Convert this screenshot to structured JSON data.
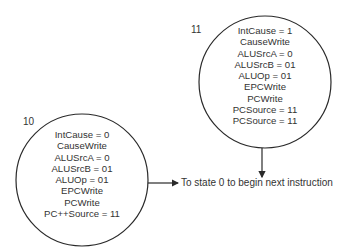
{
  "states": [
    {
      "id": "11",
      "label": "11",
      "lines": [
        "IntCause = 1",
        "CauseWrite",
        "ALUSrcA = 0",
        "ALUSrcB = 01",
        "ALUOp = 01",
        "EPCWrite",
        "PCWrite",
        "PCSource = 11",
        "PCSource = 11"
      ]
    },
    {
      "id": "10",
      "label": "10",
      "lines": [
        "IntCause = 0",
        "CauseWrite",
        "ALUSrcA = 0",
        "ALUSrcB = 01",
        "ALUOp = 01",
        "EPCWrite",
        "PCWrite",
        "PC++Source = 11"
      ]
    }
  ],
  "transition": {
    "target_text": "To state 0 to begin next instruction"
  },
  "colors": {
    "stroke": "#2a2a2a",
    "text": "#333333",
    "background": "#ffffff"
  }
}
